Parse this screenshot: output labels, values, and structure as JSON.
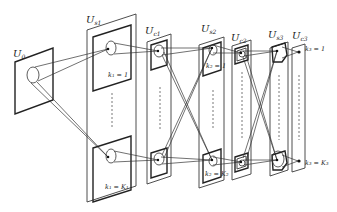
{
  "diagram": {
    "title": "",
    "layers": [
      {
        "id": "U0",
        "label": "U",
        "sub": "0"
      },
      {
        "id": "Us1",
        "label": "U",
        "sub": "s1"
      },
      {
        "id": "Uc1",
        "label": "U",
        "sub": "c1"
      },
      {
        "id": "Us2",
        "label": "U",
        "sub": "s2"
      },
      {
        "id": "Uc2",
        "label": "U",
        "sub": "c2"
      },
      {
        "id": "Us3",
        "label": "U",
        "sub": "s3"
      },
      {
        "id": "Uc3",
        "label": "U",
        "sub": "c3"
      }
    ],
    "plane_labels": {
      "s1_top": "k₁ = 1",
      "s1_bottom": "k₁ = K₁",
      "s2_top": "k₂ = 1",
      "s2_bottom": "k₂ = K₂",
      "c3_top": "k₃ = 1",
      "c3_bottom": "k₃ = K₃"
    },
    "colors": {
      "stroke": "#222222",
      "background": "#ffffff"
    }
  }
}
